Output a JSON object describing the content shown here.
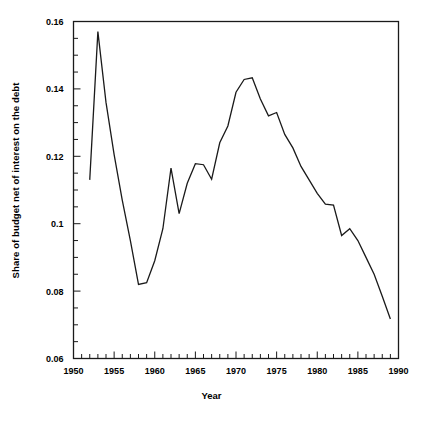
{
  "chart_data": {
    "type": "line",
    "title": "",
    "xlabel": "Year",
    "ylabel": "Share of budget net of interest on the debt",
    "xlim": [
      1950,
      1990
    ],
    "ylim": [
      0.06,
      0.16
    ],
    "grid": false,
    "legend": null,
    "xticks": [
      1950,
      1955,
      1960,
      1965,
      1970,
      1975,
      1980,
      1985,
      1990
    ],
    "xtick_labels": [
      "1950",
      "1955",
      "1960",
      "1965",
      "1970",
      "1975",
      "1980",
      "1985",
      "1990"
    ],
    "xminor_tick_interval": 1,
    "yticks": [
      0.06,
      0.08,
      0.1,
      0.12,
      0.14,
      0.16
    ],
    "ytick_labels": [
      "0.06",
      "0.08",
      "0.1",
      "0.12",
      "0.14",
      "0.16"
    ],
    "yminor_tick_interval": 0.005,
    "line_color": "#1a1a1a",
    "line_width": 1.3,
    "x": [
      1952,
      1953,
      1954,
      1955,
      1956,
      1957,
      1958,
      1959,
      1960,
      1961,
      1962,
      1963,
      1964,
      1965,
      1966,
      1967,
      1968,
      1969,
      1970,
      1971,
      1972,
      1973,
      1974,
      1975,
      1976,
      1977,
      1978,
      1979,
      1980,
      1981,
      1982,
      1983,
      1984,
      1985,
      1986,
      1987,
      1988,
      1989
    ],
    "y": [
      0.113,
      0.157,
      0.136,
      0.1205,
      0.107,
      0.095,
      0.082,
      0.0825,
      0.089,
      0.0985,
      0.1165,
      0.103,
      0.112,
      0.1178,
      0.1175,
      0.1132,
      0.124,
      0.129,
      0.139,
      0.1428,
      0.1433,
      0.137,
      0.132,
      0.133,
      0.1265,
      0.1225,
      0.117,
      0.113,
      0.109,
      0.1058,
      0.1055,
      0.0965,
      0.0985,
      0.095,
      0.09,
      0.085,
      0.0785,
      0.0717
    ]
  },
  "axis": {
    "ylabel": "Share of budget net of interest on the debt",
    "xlabel": "Year"
  },
  "caption": ""
}
